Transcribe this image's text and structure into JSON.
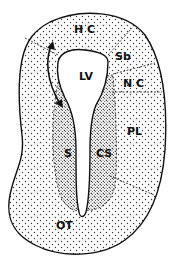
{
  "diagram": {
    "labels": {
      "hc": "H C",
      "sb": "Sb",
      "nc": "N C",
      "lv": "LV",
      "pl": "PL",
      "s": "S",
      "cs": "CS",
      "ot": "OT"
    },
    "colors": {
      "ink": "#111111",
      "background": "#ffffff",
      "dot": "#333333"
    }
  }
}
